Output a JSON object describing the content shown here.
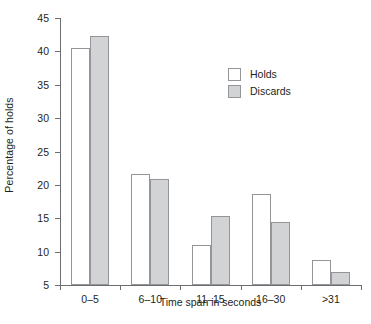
{
  "chart_data": {
    "type": "bar",
    "title": "",
    "xlabel": "Time span in seconds",
    "ylabel": "Percentage of holds",
    "categories": [
      "0–5",
      "6–10",
      "11–15",
      "16–30",
      ">31"
    ],
    "series": [
      {
        "name": "Holds",
        "values": [
          40.5,
          21.7,
          11.0,
          18.7,
          8.7
        ],
        "color": "#ffffff",
        "border_color": "#939598"
      },
      {
        "name": "Discards",
        "values": [
          42.3,
          20.9,
          15.4,
          14.5,
          6.9
        ],
        "color": "#d2d3d4",
        "border_color": "#939598"
      }
    ],
    "ylim": [
      5,
      45
    ],
    "yticks": [
      5,
      10,
      15,
      20,
      25,
      30,
      35,
      40,
      45
    ],
    "ytick_labels": [
      "5",
      "10",
      "15",
      "20",
      "25",
      "30",
      "35",
      "40",
      "45"
    ],
    "grid": false,
    "legend_position": "upper right (inside plot area)",
    "legend_entries": [
      "Holds",
      "Discards"
    ],
    "axis_color": "#6d6e71",
    "text_color": "#231f20",
    "background": "#ffffff"
  }
}
